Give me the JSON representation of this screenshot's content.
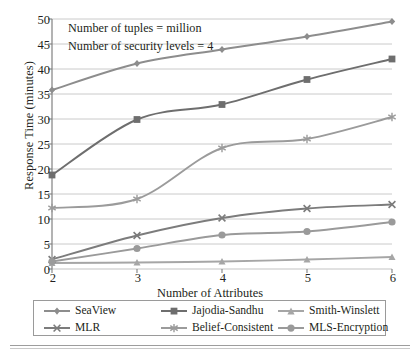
{
  "chart_data": {
    "type": "line",
    "title": "",
    "xlabel": "Number of Attributes",
    "ylabel": "Response Time (minutes)",
    "x": [
      2,
      3,
      4,
      5,
      6
    ],
    "xticklabels": [
      "2",
      "3",
      "4",
      "5",
      "6"
    ],
    "yticklabels": [
      "0",
      "5",
      "10",
      "15",
      "20",
      "25",
      "30",
      "35",
      "40",
      "45",
      "50"
    ],
    "ylim": [
      0,
      50
    ],
    "xlim": [
      2,
      6
    ],
    "ytickstep": 5,
    "grid": "horizontal",
    "legend_position": "bottom",
    "annotations": [
      "Number of tuples = million",
      "Number of security levels = 4"
    ],
    "series": [
      {
        "name": "SeaView",
        "values": [
          35.8,
          41.1,
          43.9,
          46.5,
          49.5
        ],
        "marker": "diamond",
        "color": "#8d8d8d"
      },
      {
        "name": "Jajodia-Sandhu",
        "values": [
          18.8,
          29.9,
          32.9,
          37.9,
          42.0
        ],
        "marker": "square",
        "color": "#6e6e6e"
      },
      {
        "name": "Smith-Winslett",
        "values": [
          1.2,
          1.3,
          1.5,
          1.9,
          2.4
        ],
        "marker": "triangle",
        "color": "#a6a6a6"
      },
      {
        "name": "MLR",
        "values": [
          1.9,
          6.7,
          10.2,
          12.1,
          12.9
        ],
        "marker": "cross",
        "color": "#7c7c7c"
      },
      {
        "name": "Belief-Consistent",
        "values": [
          12.2,
          14.0,
          24.2,
          26.0,
          30.4
        ],
        "marker": "star",
        "color": "#9b9b9b"
      },
      {
        "name": "MLS-Encryption",
        "values": [
          1.5,
          4.1,
          6.8,
          7.5,
          9.4
        ],
        "marker": "circle",
        "color": "#9a9a9a"
      }
    ]
  },
  "legend": {
    "entries": [
      {
        "label": "SeaView"
      },
      {
        "label": "Jajodia-Sandhu"
      },
      {
        "label": "Smith-Winslett"
      },
      {
        "label": "MLR"
      },
      {
        "label": "Belief-Consistent"
      },
      {
        "label": "MLS-Encryption"
      }
    ]
  }
}
